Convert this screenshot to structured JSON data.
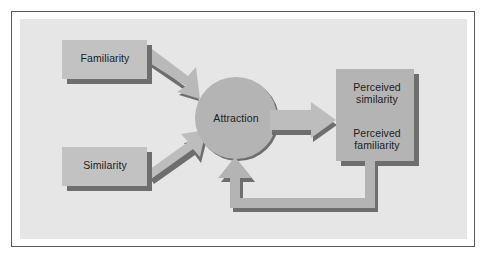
{
  "figure": {
    "type": "flow-diagram",
    "background_color": "#ffffff",
    "panel_color": "#e6e6e6",
    "frame_color": "#5a5a5a",
    "shape_fill": "#b4b4b4",
    "shape_fill_light": "#c2c2c2",
    "shadow_color": "#6e6e6e",
    "text_color": "#1d1d1d"
  },
  "nodes": {
    "familiarity": {
      "label": "Familiarity",
      "shape": "rectangle"
    },
    "similarity": {
      "label": "Similarity",
      "shape": "rectangle"
    },
    "attraction": {
      "label": "Attraction",
      "shape": "circle"
    },
    "perceived_similarity": {
      "label": "Perceived\nsimilarity",
      "shape": "rectangle"
    },
    "perceived_familiarity": {
      "label": "Perceived\nfamiliarity",
      "shape": "rectangle"
    }
  },
  "edges": [
    {
      "name": "familiarity-to-attraction",
      "from": "familiarity",
      "to": "attraction",
      "style": "block-arrow",
      "direction": "down-right"
    },
    {
      "name": "similarity-to-attraction",
      "from": "similarity",
      "to": "attraction",
      "style": "block-arrow",
      "direction": "up-right"
    },
    {
      "name": "attraction-to-perceived",
      "from": "attraction",
      "to": "perceived_similarity",
      "style": "block-arrow",
      "direction": "right"
    },
    {
      "name": "perceived-to-attraction-feedback",
      "from": "perceived_familiarity",
      "to": "attraction",
      "style": "block-arrow-elbow",
      "direction": "down-left-up"
    }
  ]
}
